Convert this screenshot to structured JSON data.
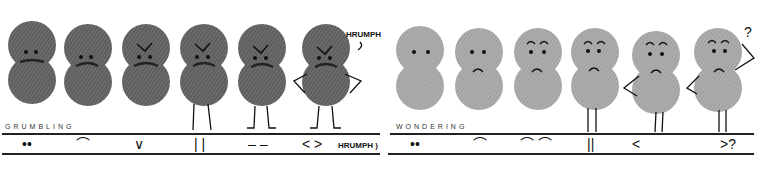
{
  "colors": {
    "grumbling_fill": "#6a6a6a",
    "wondering_fill": "#a9a9a9",
    "ink": "#151515",
    "background": "#ffffff"
  },
  "grumbling": {
    "label": "GRUMBLING",
    "figures": [
      {
        "x": 8,
        "eyes": "dots",
        "brows": "none",
        "mouth": "scribble",
        "legs": "none",
        "arms": "none"
      },
      {
        "x": 66,
        "eyes": "dots",
        "brows": "none",
        "mouth": "frown-scribble",
        "legs": "none",
        "arms": "none"
      },
      {
        "x": 124,
        "eyes": "dots",
        "brows": "angry-v",
        "mouth": "frown-scribble",
        "legs": "none",
        "arms": "none"
      },
      {
        "x": 182,
        "eyes": "dots",
        "brows": "angry-v",
        "mouth": "frown-scribble",
        "legs": "straight",
        "arms": "none"
      },
      {
        "x": 241,
        "eyes": "dots",
        "brows": "angry-v",
        "mouth": "frown-scribble",
        "legs": "feet",
        "arms": "none"
      },
      {
        "x": 305,
        "eyes": "dots",
        "brows": "angry-v",
        "mouth": "frown-scribble",
        "legs": "feet",
        "arms": "hips"
      }
    ],
    "speech": "HRUMPH",
    "key": [
      "••",
      "⌒",
      "∨",
      "| |",
      "– –",
      "< >"
    ],
    "key_note": "HRUMPH )"
  },
  "wondering": {
    "label": "WONDERING",
    "figures": [
      {
        "x": 397,
        "eyes": "dots",
        "brows": "none",
        "mouth": "none",
        "legs": "none",
        "arms": "none"
      },
      {
        "x": 456,
        "eyes": "dots",
        "brows": "none",
        "mouth": "frown",
        "legs": "none",
        "arms": "none"
      },
      {
        "x": 515,
        "eyes": "dots",
        "brows": "arched",
        "mouth": "frown",
        "legs": "none",
        "arms": "none"
      },
      {
        "x": 572,
        "eyes": "dots",
        "brows": "arched",
        "mouth": "frown",
        "legs": "straight",
        "arms": "none"
      },
      {
        "x": 635,
        "eyes": "dots",
        "brows": "arched",
        "mouth": "frown",
        "legs": "straight",
        "arms": "hip-left"
      },
      {
        "x": 697,
        "eyes": "dots",
        "brows": "arched",
        "mouth": "frown",
        "legs": "straight",
        "arms": "hip-left-head-right"
      }
    ],
    "thought": "?",
    "key": [
      "••",
      "⌒",
      "⌒ ⌒",
      "||",
      "<",
      ">?"
    ]
  }
}
